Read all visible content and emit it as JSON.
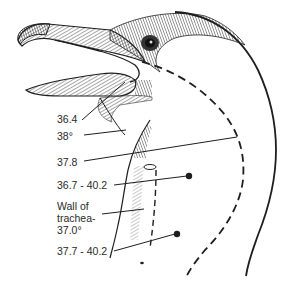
{
  "figure": {
    "colors": {
      "ink": "#1e1e1e",
      "background": "#ffffff"
    },
    "labels": [
      {
        "id": "l1",
        "text": "36.4"
      },
      {
        "id": "l2",
        "text": "38°"
      },
      {
        "id": "l3",
        "text": "37.8"
      },
      {
        "id": "l4",
        "text": "36.7 - 40.2"
      },
      {
        "id": "l5a",
        "text": "Wall of"
      },
      {
        "id": "l5b",
        "text": "trachea-"
      },
      {
        "id": "l5c",
        "text": "37.0°"
      },
      {
        "id": "l6",
        "text": "37.7 - 40.2"
      }
    ]
  }
}
